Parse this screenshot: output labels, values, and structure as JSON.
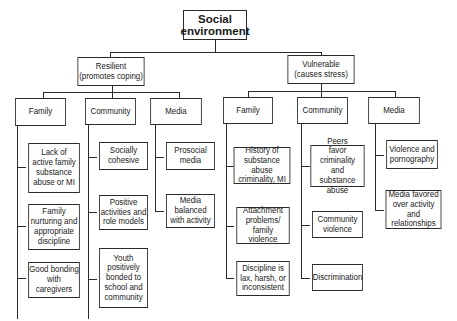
{
  "root": {
    "label": "Social\nenvironment"
  },
  "branches": [
    {
      "label": "Resilient\n(promotes coping)",
      "categories": [
        {
          "label": "Family",
          "items": [
            "Lack of\nactive family\nsubstance\nabuse or MI",
            "Family\nnurturing and\nappropriate\ndiscipline",
            "Good bonding\nwith\ncaregivers"
          ]
        },
        {
          "label": "Community",
          "items": [
            "Socially\ncohesive",
            "Positive\nactivities and\nrole models",
            "Youth\npositively\nbonded to\nschool and\ncommunity"
          ]
        },
        {
          "label": "Media",
          "items": [
            "Prosocial\nmedia",
            "Media\nbalanced\nwith activity"
          ]
        }
      ]
    },
    {
      "label": "Vulnerable\n(causes stress)",
      "categories": [
        {
          "label": "Family",
          "items": [
            "History of\nsubstance abuse\ncriminality, MI",
            "Attachment\nproblems/\nfamily violence",
            "Discipline is\nlax, harsh, or\ninconsistent"
          ]
        },
        {
          "label": "Community",
          "items": [
            "Peers\nfavor criminality\nand\nsubstance abuse",
            "Community\nviolence",
            "Discrimination"
          ]
        },
        {
          "label": "Media",
          "items": [
            "Violence and\npornography",
            "Media favored\nover activity and\nrelationships"
          ]
        }
      ]
    }
  ]
}
